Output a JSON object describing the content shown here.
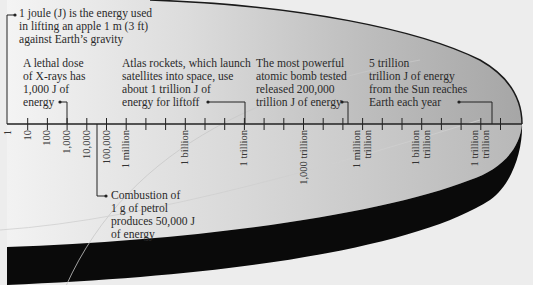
{
  "diagram": {
    "axis": {
      "min_exponent": 0,
      "max_exponent": 25,
      "tick_count": 26,
      "labels": [
        {
          "index": 0,
          "text": "1"
        },
        {
          "index": 1,
          "text": "10"
        },
        {
          "index": 2,
          "text": "100"
        },
        {
          "index": 3,
          "text": "1,000"
        },
        {
          "index": 4,
          "text": "10,000"
        },
        {
          "index": 5,
          "text": "100,000"
        },
        {
          "index": 6,
          "text": "1 million"
        },
        {
          "index": 9,
          "text": "1 billion"
        },
        {
          "index": 12,
          "text": "1 trillion"
        },
        {
          "index": 15,
          "text": "1,000 trillion"
        },
        {
          "index": 18,
          "text": "1 million\ntrillion"
        },
        {
          "index": 21,
          "text": "1 billion\ntrillion"
        },
        {
          "index": 24,
          "text": "1 trillion\ntrillion"
        }
      ]
    },
    "annotations": [
      {
        "id": "joule",
        "text": "1 joule (J) is the energy used\nin lifting an apple 1 m (3 ft)\nagainst Earth’s gravity",
        "value_joules": "1"
      },
      {
        "id": "xrays",
        "text": "A lethal dose\nof X-rays has\n1,000 J of\nenergy",
        "value_joules": "1,000"
      },
      {
        "id": "atlas",
        "text": "Atlas rockets, which launch\nsatellites into space, use\nabout 1 trillion J of\nenergy for liftoff",
        "value_joules": "1 trillion"
      },
      {
        "id": "bomb",
        "text": "The most powerful\natomic bomb tested\nreleased 200,000\ntrillion J of energy",
        "value_joules": "200,000 trillion"
      },
      {
        "id": "sun",
        "text": "5 trillion\ntrillion J of energy\nfrom the Sun reaches\nEarth each year",
        "value_joules": "5 trillion trillion"
      },
      {
        "id": "petrol",
        "text": "Combustion of\n1 g of petrol\nproduces 50,000 J\nof energy",
        "value_joules": "50,000"
      }
    ],
    "colors": {
      "background": "#ededed",
      "shape_light": "#e6e6e6",
      "shape_dark": "#a9a9a9",
      "band": "#0a0a0a",
      "axis": "#222222"
    }
  }
}
